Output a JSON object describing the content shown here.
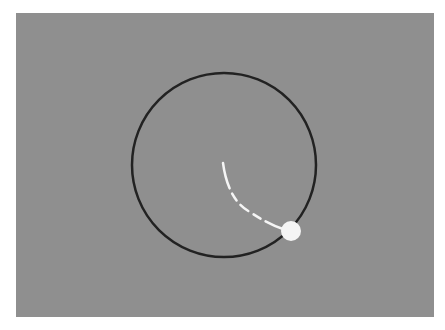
{
  "scene": {
    "background_color": "#8f8f8f",
    "page_color": "#ffffff",
    "orbit": {
      "center": [
        224,
        165
      ],
      "radius": 92,
      "stroke_color": "#222222",
      "stroke_width": 2.5
    },
    "ball": {
      "position": [
        291,
        231
      ],
      "radius": 10,
      "color": "#f5f5f5"
    },
    "trail": {
      "color": "#f5f5f5",
      "style": "dashed",
      "start": [
        223,
        163
      ],
      "end": [
        283,
        229
      ]
    }
  }
}
